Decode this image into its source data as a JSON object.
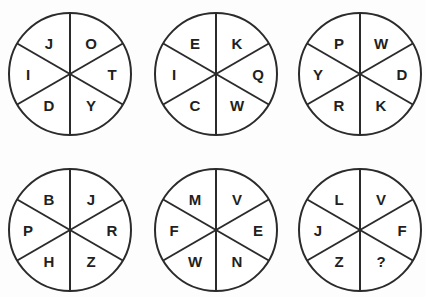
{
  "canvas": {
    "width": 425,
    "height": 297,
    "background_color": "#fdfdfd",
    "line_color": "#2b2b2b",
    "letter_color": "#231f20"
  },
  "puzzle": {
    "type": "letter-wheels",
    "wheel_count": 6,
    "sectors_per_wheel": 6,
    "rows": 2,
    "columns": 3
  },
  "wheels": [
    {
      "id": "wheel-1",
      "center_x": 70,
      "center_y": 74,
      "radius": 61,
      "sectors": [
        {
          "position": "top-left",
          "letter": "J"
        },
        {
          "position": "top-right",
          "letter": "O"
        },
        {
          "position": "middle-left",
          "letter": "I"
        },
        {
          "position": "middle-right",
          "letter": "T"
        },
        {
          "position": "bottom-left",
          "letter": "D"
        },
        {
          "position": "bottom-right",
          "letter": "Y"
        }
      ]
    },
    {
      "id": "wheel-2",
      "center_x": 216,
      "center_y": 74,
      "radius": 61,
      "sectors": [
        {
          "position": "top-left",
          "letter": "E"
        },
        {
          "position": "top-right",
          "letter": "K"
        },
        {
          "position": "middle-left",
          "letter": "I"
        },
        {
          "position": "middle-right",
          "letter": "Q"
        },
        {
          "position": "bottom-left",
          "letter": "C"
        },
        {
          "position": "bottom-right",
          "letter": "W"
        }
      ]
    },
    {
      "id": "wheel-3",
      "center_x": 360,
      "center_y": 74,
      "radius": 61,
      "sectors": [
        {
          "position": "top-left",
          "letter": "P"
        },
        {
          "position": "top-right",
          "letter": "W"
        },
        {
          "position": "middle-left",
          "letter": "Y"
        },
        {
          "position": "middle-right",
          "letter": "D"
        },
        {
          "position": "bottom-left",
          "letter": "R"
        },
        {
          "position": "bottom-right",
          "letter": "K"
        }
      ]
    },
    {
      "id": "wheel-4",
      "center_x": 70,
      "center_y": 230,
      "radius": 61,
      "sectors": [
        {
          "position": "top-left",
          "letter": "B"
        },
        {
          "position": "top-right",
          "letter": "J"
        },
        {
          "position": "middle-left",
          "letter": "P"
        },
        {
          "position": "middle-right",
          "letter": "R"
        },
        {
          "position": "bottom-left",
          "letter": "H"
        },
        {
          "position": "bottom-right",
          "letter": "Z"
        }
      ]
    },
    {
      "id": "wheel-5",
      "center_x": 216,
      "center_y": 230,
      "radius": 61,
      "sectors": [
        {
          "position": "top-left",
          "letter": "M"
        },
        {
          "position": "top-right",
          "letter": "V"
        },
        {
          "position": "middle-left",
          "letter": "F"
        },
        {
          "position": "middle-right",
          "letter": "E"
        },
        {
          "position": "bottom-left",
          "letter": "W"
        },
        {
          "position": "bottom-right",
          "letter": "N"
        }
      ]
    },
    {
      "id": "wheel-6",
      "center_x": 360,
      "center_y": 230,
      "radius": 61,
      "sectors": [
        {
          "position": "top-left",
          "letter": "L"
        },
        {
          "position": "top-right",
          "letter": "V"
        },
        {
          "position": "middle-left",
          "letter": "J"
        },
        {
          "position": "middle-right",
          "letter": "F"
        },
        {
          "position": "bottom-left",
          "letter": "Z"
        },
        {
          "position": "bottom-right",
          "letter": "?"
        }
      ]
    }
  ]
}
